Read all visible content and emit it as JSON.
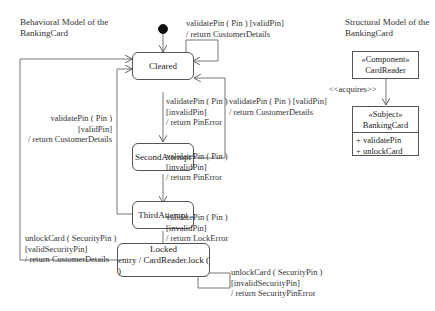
{
  "behavioral_title": [
    "Behavioral Model of the",
    "BankingCard"
  ],
  "structural_title": [
    "Structural Model of the",
    "BankingCard"
  ],
  "states": {
    "cleared": {
      "name": "Cleared"
    },
    "second_attempt": {
      "name": "SecondAttempt"
    },
    "third_attempt": {
      "name": "ThirdAttempt"
    },
    "locked": {
      "name": "Locked",
      "entry": "entry / CardReader.lock ( )"
    }
  },
  "transitions": {
    "cleared_self": [
      "validatePin ( Pin ) [validPin]",
      "/ return CustomerDetails"
    ],
    "cleared_to_second": [
      "validatePin ( Pin )",
      "[invalidPin]",
      "/ return PinError"
    ],
    "second_to_cleared": [
      "validatePin ( Pin ) [validPin]",
      "/ return CustomerDetails"
    ],
    "second_to_third": [
      "validatePin ( Pin )",
      "[invalidPin]",
      "/ return PinError"
    ],
    "third_to_cleared": [
      "validatePin ( Pin )",
      "[validPin]",
      "/ return CustomerDetails"
    ],
    "third_to_locked": [
      "validatePin ( Pin )",
      "[invalidPin]",
      "/ return LockError"
    ],
    "locked_to_cleared": [
      "unlockCard ( SecurityPin )",
      "[validSecurityPin]",
      "/ return CustomerDetails"
    ],
    "locked_self": [
      "unlockCard ( SecurityPin )",
      "[invalidSecurityPin]",
      "/ return SecurityPinError"
    ]
  },
  "structural": {
    "card_reader": {
      "stereotype": "«Component»",
      "name": "CardReader"
    },
    "association": "<<acquires>>",
    "banking_card": {
      "stereotype": "«Subject»",
      "name": "BankingCard",
      "operations": [
        "+ validatePin",
        "+ unlockCard"
      ]
    }
  }
}
